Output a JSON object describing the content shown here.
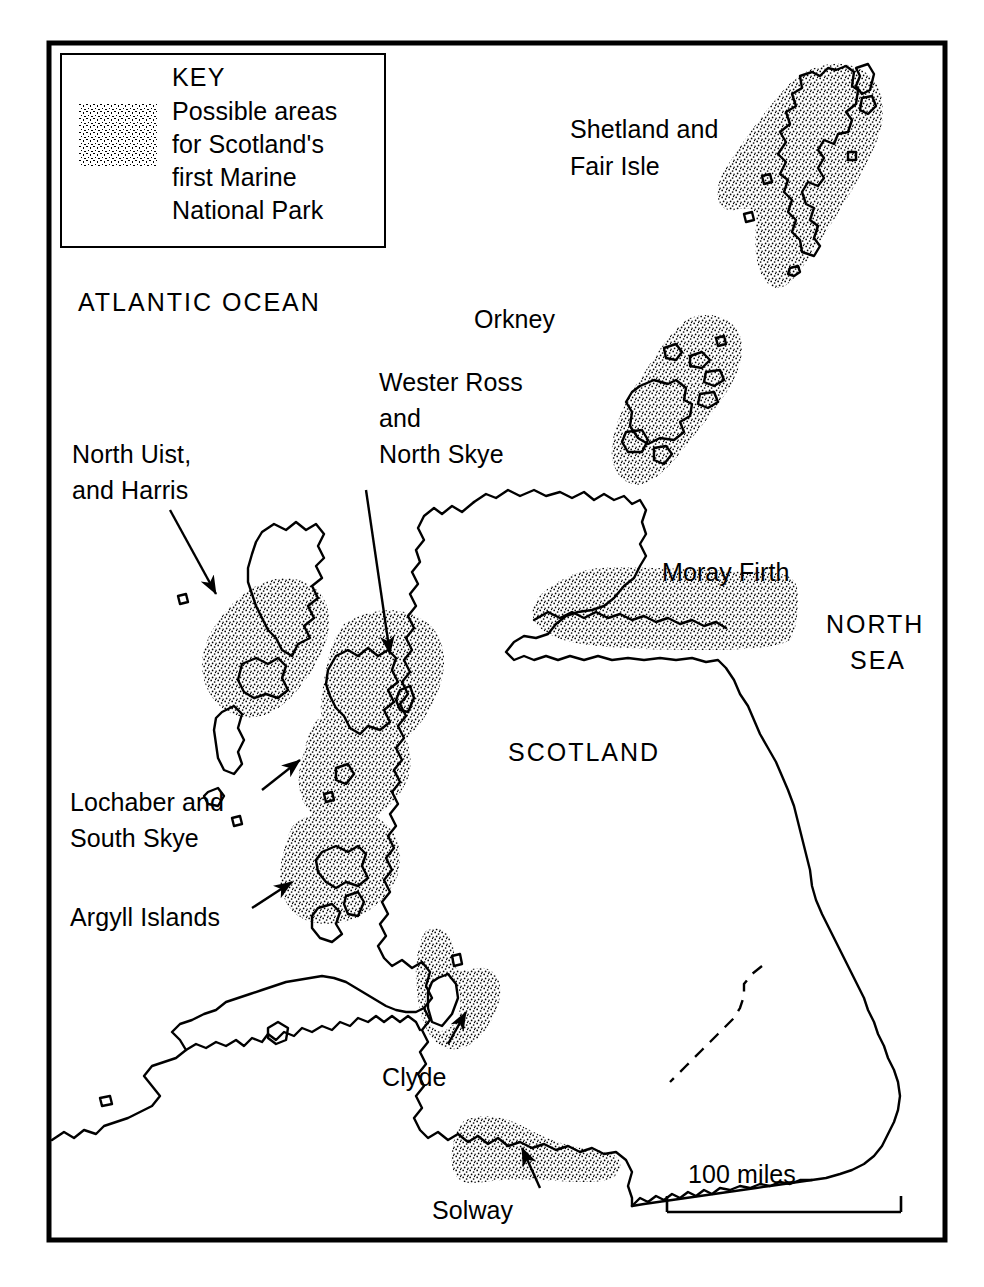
{
  "figure": {
    "type": "map",
    "subject": "Possible areas for Scotland's first Marine National Park",
    "country": "Scotland"
  },
  "key": {
    "title": "KEY",
    "swatch_name": "stipple-swatch",
    "description_lines": [
      "Possible areas",
      "for Scotland's",
      "first Marine",
      "National Park"
    ]
  },
  "water_labels": [
    {
      "id": "atlantic",
      "text": "ATLANTIC OCEAN"
    },
    {
      "id": "north-sea-line1",
      "text": "NORTH"
    },
    {
      "id": "north-sea-line2",
      "text": "SEA"
    }
  ],
  "country_label": {
    "text": "SCOTLAND"
  },
  "regions": [
    {
      "id": "shetland-fair-isle",
      "label_lines": [
        "Shetland and",
        "Fair Isle"
      ],
      "has_leader_arrow": false,
      "shaded": true
    },
    {
      "id": "orkney",
      "label_lines": [
        "Orkney"
      ],
      "has_leader_arrow": false,
      "shaded": true
    },
    {
      "id": "wester-ross-north-skye",
      "label_lines": [
        "Wester Ross",
        "and",
        "North Skye"
      ],
      "has_leader_arrow": true,
      "shaded": true
    },
    {
      "id": "north-uist-harris",
      "label_lines": [
        "North Uist,",
        "and Harris"
      ],
      "has_leader_arrow": true,
      "shaded": true
    },
    {
      "id": "moray-firth",
      "label_lines": [
        "Moray Firth"
      ],
      "has_leader_arrow": false,
      "shaded": true
    },
    {
      "id": "lochaber-south-skye",
      "label_lines": [
        "Lochaber and",
        "South Skye"
      ],
      "has_leader_arrow": true,
      "shaded": true
    },
    {
      "id": "argyll-islands",
      "label_lines": [
        "Argyll Islands"
      ],
      "has_leader_arrow": true,
      "shaded": true
    },
    {
      "id": "clyde",
      "label_lines": [
        "Clyde"
      ],
      "has_leader_arrow": true,
      "shaded": true
    },
    {
      "id": "solway",
      "label_lines": [
        "Solway"
      ],
      "has_leader_arrow": true,
      "shaded": true
    }
  ],
  "scale_bar": {
    "label": "100 miles"
  },
  "colors": {
    "ink": "#000000",
    "paper": "#ffffff",
    "stipple": "#000000"
  }
}
